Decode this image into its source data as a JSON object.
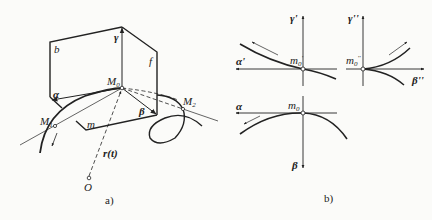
{
  "figure_a": {
    "caption": "a)",
    "labels": {
      "b": "b",
      "f": "f",
      "m": "m",
      "gamma": "γ",
      "alpha": "α",
      "beta": "β",
      "M0": "M",
      "M0_sub": "0",
      "M1": "M",
      "M1_sub": "1",
      "M2": "M",
      "M2_sub": "2",
      "r_t": "r(t)",
      "O": "O"
    }
  },
  "figure_b": {
    "caption": "b)",
    "top_left": {
      "axis_vertical": "γ'",
      "axis_horizontal": "α'",
      "point": "m",
      "point_sub": "0",
      "point_mark": "'"
    },
    "top_right": {
      "axis_vertical": "γ''",
      "axis_horizontal": "β''",
      "point": "m",
      "point_sub": "0",
      "point_mark": "''"
    },
    "bottom": {
      "axis_horizontal": "α",
      "axis_vertical": "β",
      "point": "m",
      "point_sub": "0"
    }
  },
  "colors": {
    "stroke": "#222222",
    "background": "#fbfbf9"
  }
}
